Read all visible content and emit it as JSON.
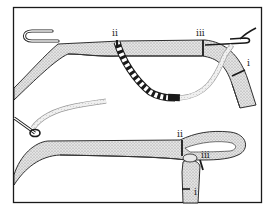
{
  "figure": {
    "frame_color": "#1a1a1a",
    "rope_fill": "#cfcfcf",
    "ink_color": "#1a1a1a"
  },
  "top_panel": {
    "labels": [
      {
        "id": "ii",
        "text": "ii"
      },
      {
        "id": "iii",
        "text": "iii"
      },
      {
        "id": "i",
        "text": "i"
      }
    ]
  },
  "bottom_panel": {
    "labels": [
      {
        "id": "ii",
        "text": "ii"
      },
      {
        "id": "iii",
        "text": "iii"
      },
      {
        "id": "i",
        "text": "i"
      }
    ]
  }
}
